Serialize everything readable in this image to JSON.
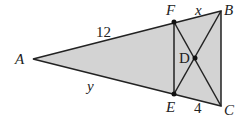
{
  "diagram": {
    "type": "geometry",
    "fill_color": "#d3d3d3",
    "stroke_color": "#222222",
    "points": {
      "A": {
        "label": "A",
        "x": 33,
        "y": 59
      },
      "F": {
        "label": "F",
        "x": 174,
        "y": 22
      },
      "B": {
        "label": "B",
        "x": 221,
        "y": 11
      },
      "E": {
        "label": "E",
        "x": 174,
        "y": 94
      },
      "C": {
        "label": "C",
        "x": 221,
        "y": 106
      },
      "D": {
        "label": "D",
        "x": 195,
        "y": 58
      }
    },
    "segment_labels": {
      "AF": "12",
      "FB": "x",
      "AE": "y",
      "EC": "4"
    }
  }
}
